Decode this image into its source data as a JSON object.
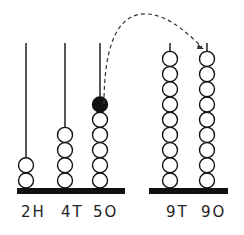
{
  "diagram": {
    "type": "abacus-regrouping",
    "colors": {
      "ink": "#111111",
      "bead_fill": "#ffffff",
      "highlight_bead": "#111111"
    },
    "left_abacus": {
      "rods": [
        {
          "label": "2H",
          "beads": 2,
          "x": 26
        },
        {
          "label": "4T",
          "beads": 4,
          "x": 65
        },
        {
          "label": "5O",
          "beads": 5,
          "x": 100,
          "extra_bead": "filled"
        }
      ]
    },
    "right_abacus": {
      "rods": [
        {
          "label": "9T",
          "beads": 9,
          "x": 170
        },
        {
          "label": "9O",
          "beads": 9,
          "x": 207
        }
      ]
    },
    "arrow": {
      "style": "dashed",
      "from": "5O filled bead",
      "to": "9O rod top"
    }
  }
}
